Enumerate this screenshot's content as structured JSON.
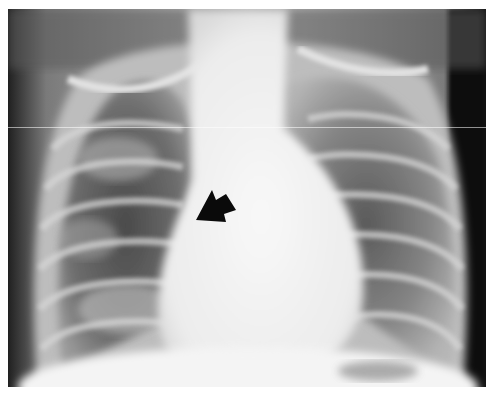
{
  "image": {
    "kind": "chest radiograph (frontal view)",
    "description": "Pediatric frontal chest X-ray showing enlarged cardiac silhouette and patchy bilateral lung opacities, with a black arrow pointing to a region right of the mediastinum.",
    "annotations": [
      {
        "type": "arrow",
        "color": "#000000",
        "direction": "pointing down-left",
        "approx_position": {
          "x": 205,
          "y": 198
        }
      }
    ],
    "colors": {
      "background": "#ffffff",
      "film_dark": "#1a1a1a",
      "bone_light": "#e6e6e6",
      "soft_tissue": "#f2f2f2"
    }
  }
}
